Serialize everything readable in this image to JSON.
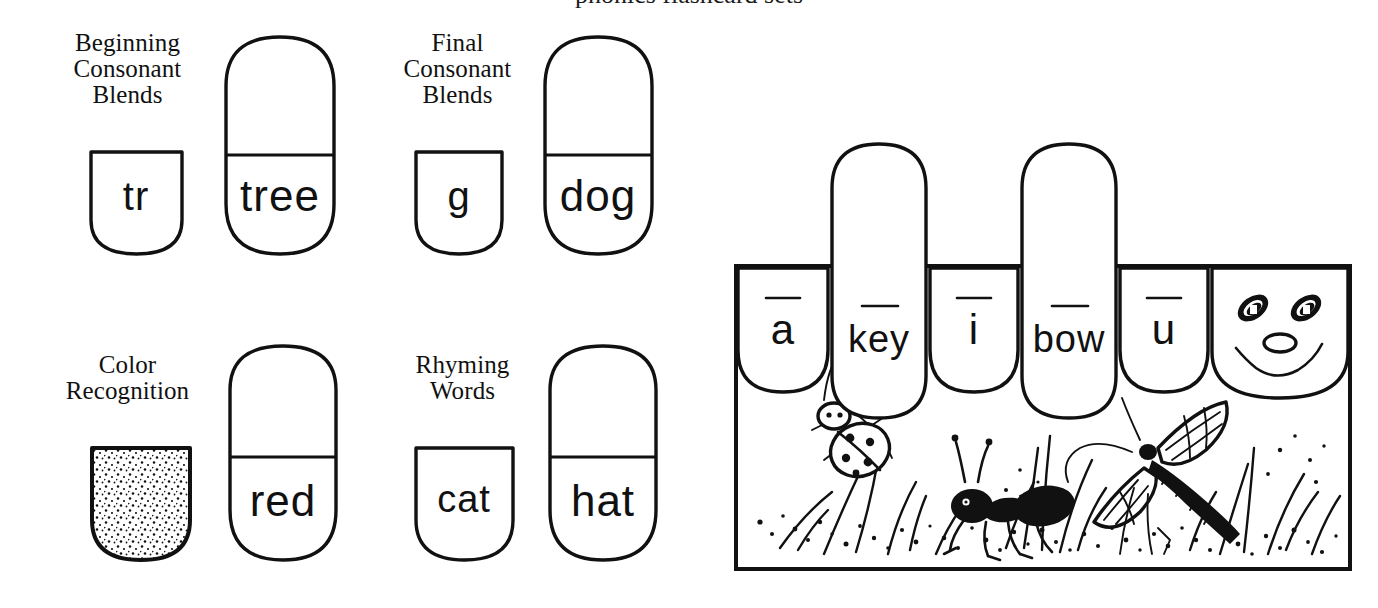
{
  "worksheet": {
    "cropped_header_text": "phonics flashcard sets",
    "ink_color": "#111111",
    "paper_color": "#ffffff"
  },
  "sections": [
    {
      "id": "beginning-consonant-blends",
      "label": "Beginning\nConsonant\nBlends",
      "small_card": {
        "text": "tr",
        "shape": "shield"
      },
      "tall_card": {
        "text": "tree",
        "shape": "pill-divided"
      }
    },
    {
      "id": "final-consonant-blends",
      "label": "Final\nConsonant\nBlends",
      "small_card": {
        "text": "g",
        "shape": "shield"
      },
      "tall_card": {
        "text": "dog",
        "shape": "pill-divided"
      }
    },
    {
      "id": "color-recognition",
      "label": "Color\nRecognition",
      "small_card": {
        "text": "",
        "shape": "shield-stippled"
      },
      "tall_card": {
        "text": "red",
        "shape": "pill-divided"
      }
    },
    {
      "id": "rhyming-words",
      "label": "Rhyming\nWords",
      "small_card": {
        "text": "cat",
        "shape": "shield"
      },
      "tall_card": {
        "text": "hat",
        "shape": "pill-divided"
      }
    }
  ],
  "scene": {
    "id": "long-vowel-box",
    "cards": [
      {
        "id": "card-a",
        "text": "a",
        "macron": true,
        "shape": "shield"
      },
      {
        "id": "card-key",
        "text": "key",
        "macron": true,
        "shape": "pill-tall"
      },
      {
        "id": "card-i",
        "text": "i",
        "macron": true,
        "shape": "shield"
      },
      {
        "id": "card-bow",
        "text": "bow",
        "macron": true,
        "shape": "pill-tall"
      },
      {
        "id": "card-u",
        "text": "u",
        "macron": true,
        "shape": "shield"
      },
      {
        "id": "card-face",
        "text": "",
        "macron": false,
        "shape": "smiley-face"
      }
    ],
    "illustration": {
      "items": [
        "ladybug",
        "ant",
        "dragonfly",
        "grass",
        "stippled-ground"
      ],
      "caption": ""
    }
  }
}
